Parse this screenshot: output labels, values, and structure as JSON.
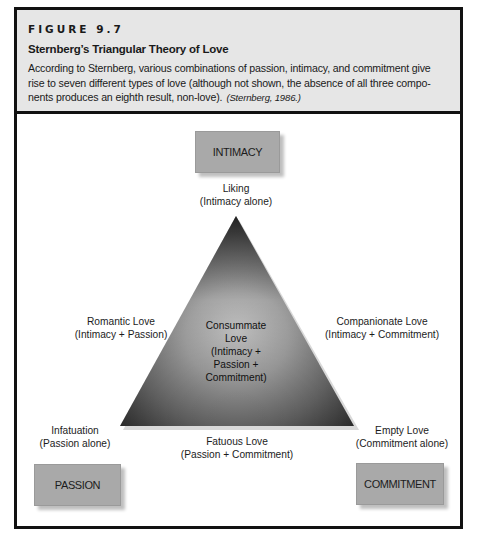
{
  "figure": {
    "number": "FIGURE 9.7",
    "title": "Sternberg’s Triangular Theory of Love",
    "caption": {
      "lines": [
        "According to Sternberg, various combinations of passion, intimacy, and commitment give",
        "rise to seven different types of love (although not shown, the absence of all three compo-",
        "nents produces an eighth result, non-love)."
      ],
      "citation": "(Sternberg, 1986.)"
    }
  },
  "diagram": {
    "corners": {
      "top": "INTIMACY",
      "bottom_left": "PASSION",
      "bottom_right": "COMMITMENT"
    },
    "vertex_labels": {
      "top": {
        "name": "Liking",
        "detail": "(Intimacy alone)"
      },
      "bottom_left": {
        "name": "Infatuation",
        "detail": "(Passion alone)"
      },
      "bottom_right": {
        "name": "Empty Love",
        "detail": "(Commitment alone)"
      }
    },
    "edge_labels": {
      "left": {
        "name": "Romantic Love",
        "detail": "(Intimacy + Passion)"
      },
      "right": {
        "name": "Companionate Love",
        "detail": "(Intimacy + Commitment)"
      },
      "bottom": {
        "name": "Fatuous Love",
        "detail": "(Passion + Commitment)"
      }
    },
    "center_label": {
      "lines": [
        "Consummate",
        "Love",
        "(Intimacy +",
        "Passion +",
        "Commitment)"
      ]
    },
    "colors": {
      "corner_box": "#a9a9a9",
      "triangle_dark": "#3a3a3a",
      "triangle_light": "#bdbdbd",
      "border": "#111111",
      "header_bg": "#e6e6e6"
    }
  }
}
